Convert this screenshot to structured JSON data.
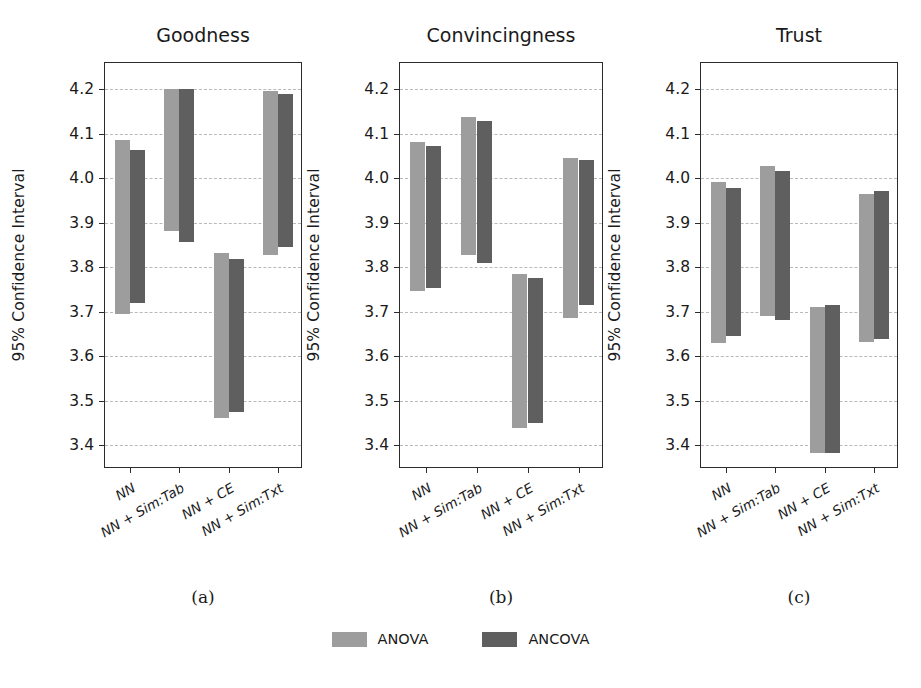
{
  "figure": {
    "ylabel": "95% Confidence Interval",
    "legend": [
      {
        "name": "ANOVA",
        "color": "#9d9d9d"
      },
      {
        "name": "ANCOVA",
        "color": "#5f5f5f"
      }
    ],
    "ylim": [
      3.33,
      4.26
    ],
    "yticks": [
      "3.4",
      "3.5",
      "3.6",
      "3.7",
      "3.8",
      "3.9",
      "4.0",
      "4.1",
      "4.2"
    ],
    "categories": [
      "NN",
      "NN + Sim:Tab",
      "NN + CE",
      "NN + Sim:Txt"
    ],
    "captions": [
      "(a)",
      "(b)",
      "(c)"
    ],
    "titles": [
      "Goodness",
      "Convincingness",
      "Trust"
    ]
  },
  "chart_data": [
    {
      "type": "bar",
      "title": "Goodness",
      "caption": "(a)",
      "xlabel": "",
      "ylabel": "95% Confidence Interval",
      "ylim": [
        3.33,
        4.26
      ],
      "yticks": [
        3.4,
        3.5,
        3.6,
        3.7,
        3.8,
        3.9,
        4.0,
        4.1,
        4.2
      ],
      "grid": true,
      "categories": [
        "NN",
        "NN + Sim:Tab",
        "NN + CE",
        "NN + Sim:Txt"
      ],
      "series": [
        {
          "name": "ANOVA",
          "color": "#9d9d9d",
          "intervals": [
            {
              "low": 3.695,
              "high": 4.085
            },
            {
              "low": 3.882,
              "high": 4.2
            },
            {
              "low": 3.46,
              "high": 3.832
            },
            {
              "low": 3.826,
              "high": 4.196
            }
          ]
        },
        {
          "name": "ANCOVA",
          "color": "#5f5f5f",
          "intervals": [
            {
              "low": 3.719,
              "high": 4.062
            },
            {
              "low": 3.856,
              "high": 4.2
            },
            {
              "low": 3.474,
              "high": 3.818
            },
            {
              "low": 3.845,
              "high": 4.188
            }
          ]
        }
      ]
    },
    {
      "type": "bar",
      "title": "Convincingness",
      "caption": "(b)",
      "xlabel": "",
      "ylabel": "95% Confidence Interval",
      "ylim": [
        3.33,
        4.26
      ],
      "yticks": [
        3.4,
        3.5,
        3.6,
        3.7,
        3.8,
        3.9,
        4.0,
        4.1,
        4.2
      ],
      "grid": true,
      "categories": [
        "NN",
        "NN + Sim:Tab",
        "NN + CE",
        "NN + Sim:Txt"
      ],
      "series": [
        {
          "name": "ANOVA",
          "color": "#9d9d9d",
          "intervals": [
            {
              "low": 3.746,
              "high": 4.08
            },
            {
              "low": 3.828,
              "high": 4.137
            },
            {
              "low": 3.438,
              "high": 3.784
            },
            {
              "low": 3.686,
              "high": 4.046
            }
          ]
        },
        {
          "name": "ANCOVA",
          "color": "#5f5f5f",
          "intervals": [
            {
              "low": 3.752,
              "high": 4.072
            },
            {
              "low": 3.808,
              "high": 4.128
            },
            {
              "low": 3.45,
              "high": 3.776
            },
            {
              "low": 3.714,
              "high": 4.04
            }
          ]
        }
      ]
    },
    {
      "type": "bar",
      "title": "Trust",
      "caption": "(c)",
      "xlabel": "",
      "ylabel": "95% Confidence Interval",
      "ylim": [
        3.33,
        4.26
      ],
      "yticks": [
        3.4,
        3.5,
        3.6,
        3.7,
        3.8,
        3.9,
        4.0,
        4.1,
        4.2
      ],
      "grid": true,
      "categories": [
        "NN",
        "NN + Sim:Tab",
        "NN + CE",
        "NN + Sim:Txt"
      ],
      "series": [
        {
          "name": "ANOVA",
          "color": "#9d9d9d",
          "intervals": [
            {
              "low": 3.629,
              "high": 3.992
            },
            {
              "low": 3.69,
              "high": 4.027
            },
            {
              "low": 3.381,
              "high": 3.71
            },
            {
              "low": 3.631,
              "high": 3.964
            }
          ]
        },
        {
          "name": "ANCOVA",
          "color": "#5f5f5f",
          "intervals": [
            {
              "low": 3.646,
              "high": 3.978
            },
            {
              "low": 3.681,
              "high": 4.015
            },
            {
              "low": 3.383,
              "high": 3.714
            },
            {
              "low": 3.638,
              "high": 3.971
            }
          ]
        }
      ]
    }
  ]
}
